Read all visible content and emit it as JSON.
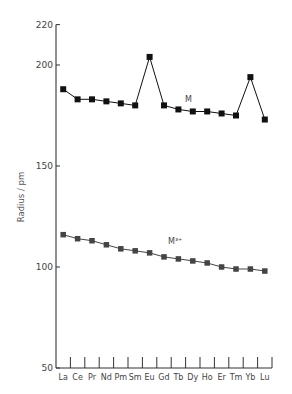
{
  "chart_data": {
    "type": "line",
    "title": "",
    "xlabel": "",
    "ylabel": "Radius / pm",
    "ylim": [
      50,
      220
    ],
    "yticks": [
      50,
      100,
      150,
      200,
      220
    ],
    "grid": false,
    "legend": "inline labels",
    "categories": [
      "La",
      "Ce",
      "Pr",
      "Nd",
      "Pm",
      "Sm",
      "Eu",
      "Gd",
      "Tb",
      "Dy",
      "Ho",
      "Er",
      "Tm",
      "Yb",
      "Lu"
    ],
    "series": [
      {
        "name": "M",
        "color": "#111111",
        "values": [
          188,
          183,
          183,
          182,
          181,
          180,
          204,
          180,
          178,
          177,
          177,
          176,
          175,
          194,
          173
        ]
      },
      {
        "name": "M³⁺",
        "color": "#444444",
        "values": [
          116,
          114,
          113,
          111,
          109,
          108,
          107,
          105,
          104,
          103,
          102,
          100,
          99,
          99,
          98
        ]
      }
    ],
    "annotations": [
      {
        "text": "M",
        "near_category": "Dy",
        "series": "M"
      },
      {
        "text": "M³⁺",
        "near_category": "Tb",
        "series": "M³⁺"
      }
    ]
  }
}
